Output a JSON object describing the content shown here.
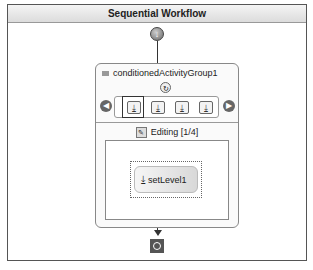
{
  "workflow": {
    "title": "Sequential Workflow",
    "start_icon": "start-icon",
    "end_icon": "end-icon"
  },
  "group": {
    "title": "conditionedActivityGroup1",
    "condition_icon": "condition-icon",
    "nav_prev": "◀",
    "nav_next": "▶",
    "activities": [
      "activity-1",
      "activity-2",
      "activity-3",
      "activity-4"
    ],
    "editing_label": "Editing [1/4]",
    "activity_label": "setLevel1"
  }
}
